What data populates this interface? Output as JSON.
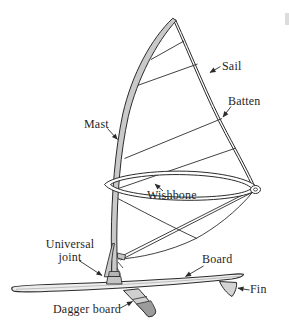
{
  "diagram": {
    "labels": {
      "sail": "Sail",
      "batten": "Batten",
      "mast": "Mast",
      "wishbone": "Wishbone",
      "universal_joint": "Universal\njoint",
      "board": "Board",
      "fin": "Fin",
      "dagger_board": "Dagger board"
    },
    "colors": {
      "background": "#ffffff",
      "outline": "#2b2b2b",
      "text": "#1f1f1f",
      "mast_fill": "#c9c9c9",
      "board_fill": "#ededed",
      "fin_fill": "#d4d4d4",
      "dagger_fill": "#cfcfcf",
      "dagger_tip_fill": "#9c9c9c",
      "hardware_fill": "#c4c4c4",
      "edge_mark": "#dcdcdc"
    }
  }
}
